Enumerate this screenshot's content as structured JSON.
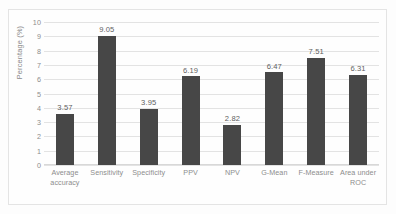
{
  "chart_data": {
    "type": "bar",
    "title": "",
    "subtitle": "",
    "xlabel": "",
    "ylabel": "Percentage (%)",
    "ylim": [
      0,
      10
    ],
    "ytick_labels": [
      "10",
      "9",
      "8",
      "7",
      "6",
      "5",
      "4",
      "3",
      "2",
      "1",
      "0"
    ],
    "ytick_values": [
      10,
      9,
      8,
      7,
      6,
      5,
      4,
      3,
      2,
      1,
      0
    ],
    "grid": true,
    "legend": "none",
    "legend_position": "none",
    "bar_color": "#474747",
    "gridline_color": "#e3e3e3",
    "categories": [
      "Average accuracy",
      "Sensitivity",
      "Specificity",
      "PPV",
      "NPV",
      "G-Mean",
      "F-Measure",
      "Area under ROC"
    ],
    "category_lines": [
      [
        "Average",
        "accuracy"
      ],
      [
        "Sensitivity"
      ],
      [
        "Specificity"
      ],
      [
        "PPV"
      ],
      [
        "NPV"
      ],
      [
        "G-Mean"
      ],
      [
        "F-Measure"
      ],
      [
        "Area under",
        "ROC"
      ]
    ],
    "values": [
      3.57,
      9.05,
      3.95,
      6.19,
      2.82,
      6.47,
      7.51,
      6.31
    ],
    "data_labels": [
      "3.57",
      "9.05",
      "3.95",
      "6.19",
      "2.82",
      "6.47",
      "7.51",
      "6.31"
    ]
  }
}
